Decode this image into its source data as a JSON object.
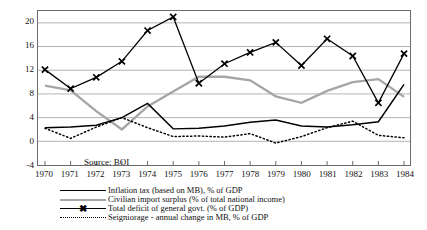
{
  "chart_data": {
    "type": "line",
    "title": "",
    "xlabel": "",
    "ylabel": "",
    "ylim": [
      -4,
      22
    ],
    "xlim": [
      1970,
      1984
    ],
    "yticks": [
      20,
      16,
      12,
      8,
      4,
      0,
      -4
    ],
    "grid": true,
    "legend_position": "bottom",
    "x": [
      1970,
      1971,
      1972,
      1973,
      1974,
      1975,
      1976,
      1977,
      1978,
      1979,
      1980,
      1981,
      1982,
      1983,
      1984
    ],
    "categories": [
      "1970",
      "1971",
      "1972",
      "1973",
      "1974",
      "1975",
      "1976",
      "1977",
      "1978",
      "1979",
      "1980",
      "1981",
      "1982",
      "1983",
      "1984"
    ],
    "series": [
      {
        "name": "Inflation tax (based on MB), % of GDP",
        "style": "solid-black",
        "color": "#000000",
        "marker": "none",
        "values": [
          2.3,
          2.4,
          2.7,
          4.0,
          6.4,
          2.1,
          2.2,
          2.6,
          3.2,
          3.6,
          2.6,
          2.4,
          2.8,
          3.3,
          9.6
        ]
      },
      {
        "name": "Civilian import surplus (% of total national income)",
        "style": "solid-gray",
        "color": "#a6a6a6",
        "marker": "none",
        "values": [
          9.4,
          8.6,
          5.1,
          2.0,
          5.9,
          8.4,
          10.9,
          10.9,
          10.3,
          7.6,
          6.5,
          8.5,
          10.0,
          10.5,
          7.5
        ]
      },
      {
        "name": "Total deficit of general govt. (% of GDP)",
        "style": "solid-black-x",
        "color": "#000000",
        "marker": "x",
        "values": [
          12.1,
          8.9,
          10.8,
          13.5,
          18.7,
          21.0,
          9.8,
          13.1,
          15.0,
          16.7,
          12.8,
          17.3,
          14.4,
          6.5,
          14.8
        ]
      },
      {
        "name": "Seigniorage - annual change in MB, % of GDP",
        "style": "dotted-black",
        "color": "#000000",
        "marker": "none",
        "values": [
          2.2,
          0.5,
          2.4,
          4.0,
          2.3,
          0.8,
          0.9,
          0.7,
          1.3,
          -0.3,
          0.8,
          2.3,
          3.4,
          1.0,
          0.6
        ]
      }
    ]
  },
  "y_axis": {
    "ticks": [
      "20",
      "16",
      "12",
      "8",
      "4",
      "0",
      "-4"
    ]
  },
  "x_axis": {
    "ticks": [
      "1970",
      "1971",
      "1972",
      "1973",
      "1974",
      "1975",
      "1976",
      "1977",
      "1978",
      "1979",
      "1980",
      "1981",
      "1982",
      "1983",
      "1984"
    ]
  },
  "annotations": {
    "source": "Source: BOI"
  },
  "legend": {
    "items": [
      {
        "label": "Inflation tax (based on MB), % of GDP",
        "style": "solid-black"
      },
      {
        "label": "Civilian import surplus (% of total national income)",
        "style": "solid-gray"
      },
      {
        "label": "Total deficit of general govt. (% of GDP)",
        "style": "solid-black-x"
      },
      {
        "label": "Seigniorage - annual change in MB, % of GDP",
        "style": "dotted-black"
      }
    ]
  },
  "colors": {
    "grid": "#b3b3b3",
    "frame": "#6b6b6b",
    "series_black": "#000000",
    "series_gray": "#a6a6a6",
    "background": "#ffffff"
  }
}
